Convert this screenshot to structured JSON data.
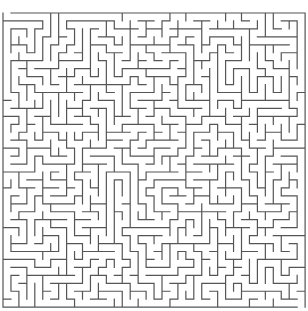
{
  "maze": {
    "cols": 38,
    "rows": 37,
    "cell_size": 7.95,
    "origin_x": 3,
    "origin_y": 13,
    "wall_color": "#555555",
    "background": "#ffffff",
    "wall_width": 1.2,
    "seed": 20240611,
    "entrance": {
      "side": "top",
      "col": 0
    },
    "exit": {
      "side": "bottom",
      "col": 37
    }
  }
}
